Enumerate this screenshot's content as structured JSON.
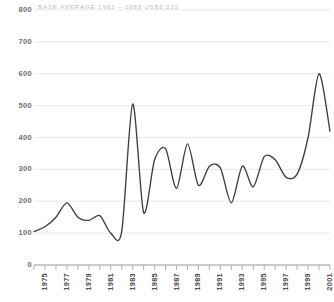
{
  "annotation": {
    "note": "BASE AVERAGE 1963 – 1983 US$3,232"
  },
  "colors": {
    "line": "#3d3d3d",
    "gridline": "#dedede",
    "axis": "#8a8a8a",
    "y_label": "#6d6d6d",
    "x_label": "#4a4a4a",
    "note": "#b9b9b9",
    "background": "#ffffff"
  },
  "chart_data": {
    "type": "line",
    "title": "",
    "subtitle": "",
    "xlabel": "",
    "ylabel": "",
    "xlim": [
      1974,
      2001
    ],
    "ylim": [
      0,
      800
    ],
    "grid": true,
    "legend": null,
    "annotations": [
      "BASE AVERAGE 1963 – 1983 US$3,232"
    ],
    "y_ticks": [
      0,
      100,
      200,
      300,
      400,
      500,
      600,
      700,
      800
    ],
    "x_ticks": [
      1975,
      1977,
      1979,
      1981,
      1983,
      1985,
      1987,
      1989,
      1991,
      1993,
      1995,
      1997,
      1999,
      2001
    ],
    "x": [
      1974,
      1975,
      1976,
      1977,
      1978,
      1979,
      1980,
      1981,
      1982,
      1983,
      1984,
      1985,
      1986,
      1987,
      1988,
      1989,
      1990,
      1991,
      1992,
      1993,
      1994,
      1995,
      1996,
      1997,
      1998,
      1999,
      2000,
      2001
    ],
    "values": [
      105,
      120,
      150,
      195,
      150,
      140,
      155,
      100,
      105,
      505,
      165,
      330,
      365,
      240,
      380,
      250,
      310,
      305,
      195,
      310,
      245,
      340,
      330,
      275,
      285,
      400,
      600,
      420
    ]
  }
}
